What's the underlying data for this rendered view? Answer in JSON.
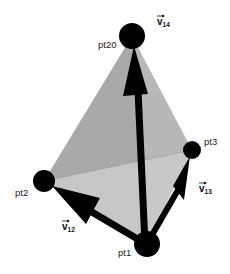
{
  "diagram": {
    "type": "tetrahedron with vectors",
    "points": [
      {
        "id": "pt1",
        "label": "pt1"
      },
      {
        "id": "pt2",
        "label": "pt2"
      },
      {
        "id": "pt3",
        "label": "pt3"
      },
      {
        "id": "pt20",
        "label": "pt20"
      }
    ],
    "vectors": [
      {
        "id": "v12",
        "symbol": "v",
        "subscript": "12",
        "from": "pt1",
        "to": "pt2"
      },
      {
        "id": "v13",
        "symbol": "v",
        "subscript": "13",
        "from": "pt1",
        "to": "pt3"
      },
      {
        "id": "v14",
        "symbol": "v",
        "subscript": "14",
        "from": "pt1",
        "to": "pt20"
      }
    ],
    "colors": {
      "face_left": "#a9a9a9",
      "face_right": "#b8b8b8",
      "face_bottom": "#cacaca",
      "points": "#000000",
      "vectors": "#000000"
    }
  }
}
